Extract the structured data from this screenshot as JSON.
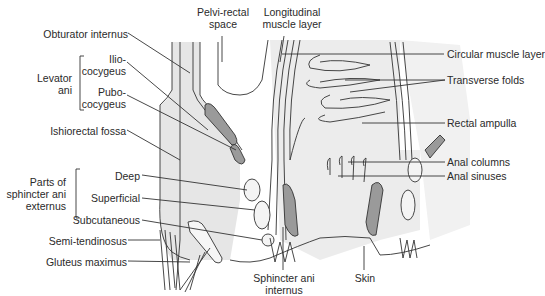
{
  "diagram": {
    "type": "anatomical-illustration",
    "colors": {
      "background": "#ffffff",
      "tissue_shade": "#e4e4e4",
      "muscle_dark": "#9a9a9a",
      "line": "#333333",
      "text": "#2a2a2a"
    },
    "labels": {
      "obturator_internus": "Obturator internus",
      "levator_ani": [
        "Levator",
        "ani"
      ],
      "ilio_cocygeus": [
        "Ilio-",
        "cocygeus"
      ],
      "pubo_cocygeus": [
        "Pubo-",
        "cocygeus"
      ],
      "ishiorectal_fossa": "Ishiorectal fossa",
      "parts_sphincter": [
        "Parts of",
        "sphincter ani",
        "externus"
      ],
      "deep": "Deep",
      "superficial": "Superficial",
      "subcutaneous": "Subcutaneous",
      "semi_tendinosus": "Semi-tendinosus",
      "gluteus_maximus": "Gluteus maximus",
      "pelvi_rectal_space": [
        "Pelvi-rectal",
        "space"
      ],
      "longitudinal_muscle": [
        "Longitudinal",
        "muscle layer"
      ],
      "circular_muscle": "Circular muscle layer",
      "transverse_folds": "Transverse folds",
      "rectal_ampulla": "Rectal ampulla",
      "anal_columns": "Anal columns",
      "anal_sinuses": "Anal sinuses",
      "sphincter_ani_internus": [
        "Sphincter ani",
        "internus"
      ],
      "skin": "Skin"
    }
  }
}
